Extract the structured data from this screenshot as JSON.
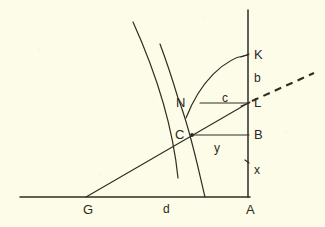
{
  "figure": {
    "background_color": "#fdfce9",
    "ink_color": "#2e2c24",
    "caption": "",
    "points": [
      {
        "id": "A",
        "label": "A",
        "x": 248,
        "y": 197,
        "label_x": 246,
        "label_y": 203
      },
      {
        "id": "B",
        "label": "B",
        "x": 248,
        "y": 135,
        "label_x": 254,
        "label_y": 128
      },
      {
        "id": "C",
        "label": "C",
        "x": 192,
        "y": 135,
        "label_x": 175,
        "label_y": 128
      },
      {
        "id": "G",
        "label": "G",
        "x": 88,
        "y": 197,
        "label_x": 83,
        "label_y": 203
      },
      {
        "id": "K",
        "label": "K",
        "x": 248,
        "y": 55,
        "label_x": 254,
        "label_y": 48
      },
      {
        "id": "L",
        "label": "L",
        "x": 248,
        "y": 103,
        "label_x": 254,
        "label_y": 96
      },
      {
        "id": "N",
        "label": "N",
        "x": 200,
        "y": 103,
        "label_x": 176,
        "label_y": 96
      }
    ],
    "segment_labels": [
      {
        "id": "b",
        "label": "b",
        "label_x": 254,
        "label_y": 72
      },
      {
        "id": "c",
        "label": "c",
        "label_x": 222,
        "label_y": 92
      },
      {
        "id": "d",
        "label": "d",
        "label_x": 163,
        "label_y": 203
      },
      {
        "id": "x",
        "label": "x",
        "label_x": 254,
        "label_y": 164
      },
      {
        "id": "y",
        "label": "y",
        "label_x": 214,
        "label_y": 142
      }
    ],
    "strokes": {
      "baseline": "M 20 197 L 250 197",
      "vertical_axis": "M 248 10 L 248 197",
      "chord_G_to_L": "M 86 197 L 250 102",
      "dashed_ray": "M 252 101 L 314 73",
      "horizontal_N_L": "M 200 103 L 249 103",
      "horizontal_C_B": "M 192 135 L 249 135",
      "arc_N_to_K": "M 186 118 C 200 82 224 58 248 55",
      "curve_descending": "M 133 22 C 152 64 172 118 178 178",
      "curve_rising": "M 205 197 C 198 168 190 128 178 98 C 172 78 166 60 160 44"
    },
    "tick_marks": [
      {
        "id": "tick-K",
        "path": "M 241 57 L 249 54"
      },
      {
        "id": "tick-L",
        "path": "M 241 106 L 249 103"
      },
      {
        "id": "tick-x",
        "path": "M 245 160 L 249 163"
      }
    ]
  }
}
